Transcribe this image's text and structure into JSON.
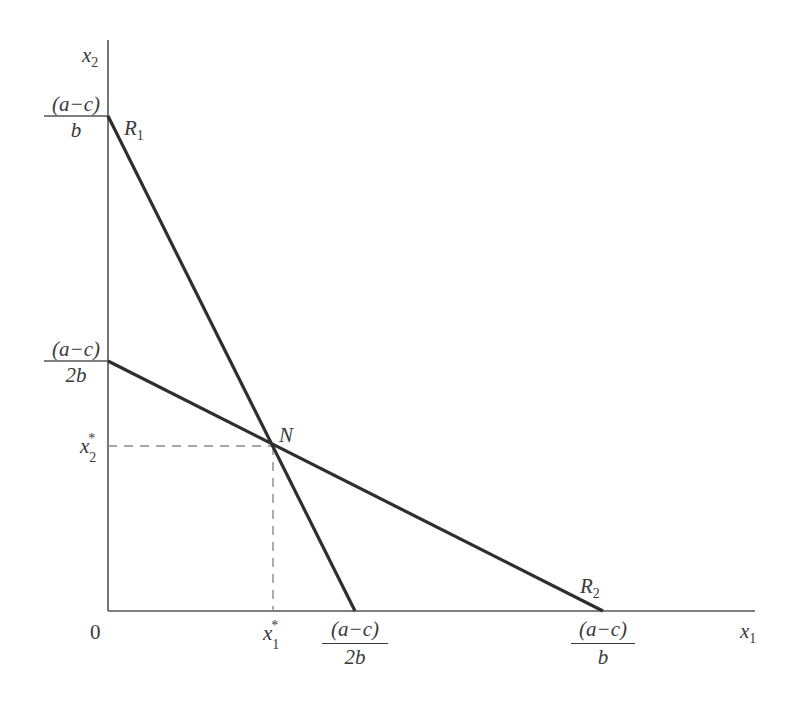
{
  "diagram": {
    "type": "reaction-function-equilibrium",
    "axes": {
      "origin_label": "0",
      "x_axis_label": {
        "base": "x",
        "sub": "1"
      },
      "y_axis_label": {
        "base": "x",
        "sub": "2"
      }
    },
    "y_ticks": [
      {
        "numerator": "(a−c)",
        "denominator": "b"
      },
      {
        "numerator": "(a−c)",
        "denominator": "2b"
      },
      {
        "base": "x",
        "sub": "2",
        "sup": "*"
      }
    ],
    "x_ticks": [
      {
        "base": "x",
        "sub": "1",
        "sup": "*"
      },
      {
        "numerator": "(a−c)",
        "denominator": "2b"
      },
      {
        "numerator": "(a−c)",
        "denominator": "b"
      }
    ],
    "lines": [
      {
        "name": "R",
        "sub": "1",
        "from": "y = (a−c)/b",
        "to": "x = (a−c)/2b"
      },
      {
        "name": "R",
        "sub": "2",
        "from": "y = (a−c)/2b",
        "to": "x = (a−c)/b"
      }
    ],
    "intersection": {
      "label": "N",
      "x": "x1*",
      "y": "x2*"
    },
    "colors": {
      "line": "#2e2e2e",
      "axis": "#555555",
      "dashed": "#8a8a8a",
      "text": "#3a3a3a"
    }
  }
}
